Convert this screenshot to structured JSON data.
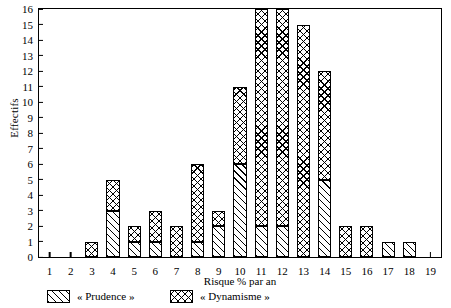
{
  "chart_data": {
    "type": "bar",
    "title": "",
    "subtitle": "",
    "xlabel": "Risque % par an",
    "ylabel": "Effectifs",
    "stacked": true,
    "grid": false,
    "legend_position": "bottom",
    "xlim": [
      1,
      19
    ],
    "ylim": [
      0,
      16
    ],
    "ytick_step": 1,
    "categories": [
      "1",
      "2",
      "3",
      "4",
      "5",
      "6",
      "7",
      "8",
      "9",
      "10",
      "11",
      "12",
      "13",
      "14",
      "15",
      "16",
      "17",
      "18",
      "19"
    ],
    "xtick_labels": [
      "1",
      "2",
      "3",
      "4",
      "5",
      "6",
      "7",
      "8",
      "9",
      "10",
      "11",
      "12",
      "13",
      "14",
      "15",
      "16",
      "17",
      "18",
      "19"
    ],
    "ytick_labels": [
      "0",
      "1",
      "2",
      "3",
      "4",
      "5",
      "6",
      "7",
      "8",
      "9",
      "10",
      "11",
      "12",
      "13",
      "14",
      "15",
      "16"
    ],
    "series": [
      {
        "name": "« Prudence »",
        "pattern": "diagonal-hatch",
        "color": "#000000",
        "values": [
          0,
          0,
          0,
          3,
          1,
          1,
          0,
          1,
          2,
          6,
          2,
          2,
          0,
          5,
          0,
          0,
          1,
          1,
          0
        ]
      },
      {
        "name": "« Dynamisme »",
        "pattern": "cross-hatch",
        "color": "#000000",
        "values": [
          0,
          0,
          1,
          2,
          1,
          2,
          2,
          5,
          1,
          5,
          14,
          14,
          15,
          7,
          2,
          2,
          0,
          0,
          0
        ]
      }
    ],
    "totals": [
      0,
      0,
      1,
      5,
      2,
      3,
      2,
      6,
      3,
      11,
      16,
      16,
      15,
      12,
      2,
      2,
      1,
      1,
      0
    ]
  },
  "legend": {
    "items": [
      {
        "label": "« Prudence »",
        "pattern": "diagonal-hatch"
      },
      {
        "label": "« Dynamisme »",
        "pattern": "cross-hatch"
      }
    ]
  }
}
